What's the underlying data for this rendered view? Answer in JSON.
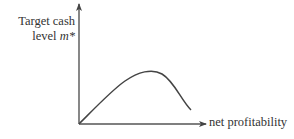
{
  "diagram": {
    "y_axis": {
      "label_line1": "Target cash",
      "label_line2_text": "level ",
      "label_line2_symbol": "m*"
    },
    "x_axis": {
      "label": "net profitability"
    },
    "curve": {
      "description": "hump-shaped curve rising from origin to a peak then declining",
      "shape": "inverted-U"
    },
    "colors": {
      "axis": "#555555",
      "curve": "#444444",
      "text": "#333333"
    }
  }
}
